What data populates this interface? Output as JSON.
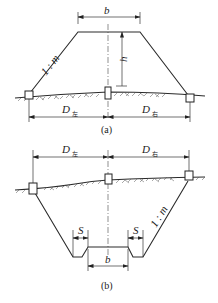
{
  "figure": {
    "panel_a": {
      "caption": "(a)",
      "title": "embankment cross-section",
      "labels": {
        "top_width": "b",
        "height": "h",
        "slope": "1 : m",
        "left_distance": "D",
        "left_distance_sub": "左",
        "right_distance": "D",
        "right_distance_sub": "右"
      }
    },
    "panel_b": {
      "caption": "(b)",
      "title": "cutting cross-section",
      "labels": {
        "bottom_width": "b",
        "ditch_left": "S",
        "ditch_right": "S",
        "slope": "1 : m",
        "left_distance": "D",
        "left_distance_sub": "左",
        "right_distance": "D",
        "right_distance_sub": "右"
      }
    }
  }
}
